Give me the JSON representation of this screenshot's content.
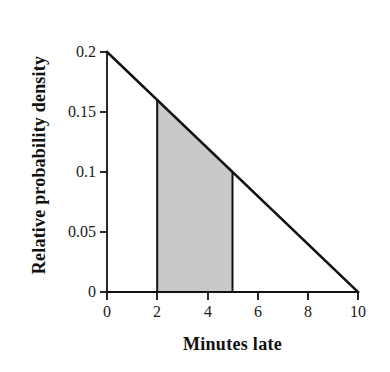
{
  "chart_data": {
    "type": "area",
    "title": "",
    "xlabel": "Minutes late",
    "ylabel": "Relative probability density",
    "xlim": [
      0,
      10
    ],
    "ylim": [
      0,
      0.2
    ],
    "grid": false,
    "legend": null,
    "xticks": [
      0,
      2,
      4,
      6,
      8,
      10
    ],
    "xticklabels": [
      "0",
      "2",
      "4",
      "6",
      "8",
      "10"
    ],
    "yticks": [
      0,
      0.05,
      0.1,
      0.15,
      0.2
    ],
    "yticklabels": [
      "0",
      "0.05",
      "0.1",
      "0.15",
      "0.2"
    ],
    "series": [
      {
        "name": "Probability density",
        "kind": "line",
        "x": [
          0,
          10
        ],
        "values": [
          0.2,
          0.0
        ]
      },
      {
        "name": "Shaded region 2 to 5 minutes",
        "kind": "shaded-area",
        "x": [
          2,
          5
        ],
        "values": [
          0.16,
          0.1
        ],
        "fill_color": "#c9c9c9",
        "area": 0.39
      }
    ],
    "line_color": "#111111",
    "axis_color": "#111111"
  },
  "axis_labels": {
    "x_title": "Minutes late",
    "y_title": "Relative probability density"
  },
  "colors": {
    "background": "#ffffff",
    "ink": "#111111",
    "shade": "#c9c9c9",
    "tick_text": "#1a1a1a"
  }
}
